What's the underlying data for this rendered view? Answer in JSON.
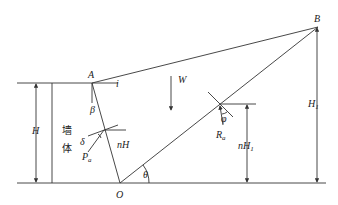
{
  "diagram": {
    "type": "retaining-wall-force-diagram",
    "points": {
      "A": {
        "label": "A"
      },
      "B": {
        "label": "B"
      },
      "O": {
        "label": "O"
      }
    },
    "labels": {
      "i": "i",
      "beta": "β",
      "W": "W",
      "H": "H",
      "wall_line1": "墙",
      "wall_line2": "体",
      "delta": "δ",
      "Pa": "P",
      "Pa_sub": "a",
      "nH": "nH",
      "theta": "θ",
      "phi": "φ",
      "Ra": "R",
      "Ra_sub": "a",
      "nH1": "nH",
      "nH1_sub": "1",
      "H1": "H",
      "H1_sub": "1"
    }
  }
}
